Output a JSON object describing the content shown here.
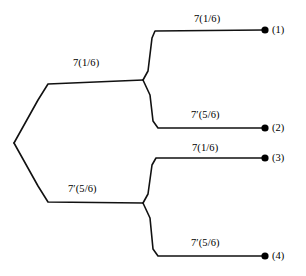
{
  "diagram": {
    "type": "probability-tree",
    "stroke_color": "#111111",
    "node_color": "#000000",
    "background_color": "#ffffff",
    "branches": [
      {
        "id": "root-upper",
        "label": "7(1/6)",
        "level": 1
      },
      {
        "id": "root-lower",
        "label": "7′(5/6)",
        "level": 1
      },
      {
        "id": "upper-to-node-1",
        "label": "7(1/6)",
        "level": 2
      },
      {
        "id": "upper-to-node-2",
        "label": "7′(5/6)",
        "level": 2
      },
      {
        "id": "lower-to-node-3",
        "label": "7(1/6)",
        "level": 2
      },
      {
        "id": "lower-to-node-4",
        "label": "7′(5/6)",
        "level": 2
      }
    ],
    "terminal_nodes": [
      {
        "id": "node-1",
        "label": "(1)"
      },
      {
        "id": "node-2",
        "label": "(2)"
      },
      {
        "id": "node-3",
        "label": "(3)"
      },
      {
        "id": "node-4",
        "label": "(4)"
      }
    ]
  }
}
